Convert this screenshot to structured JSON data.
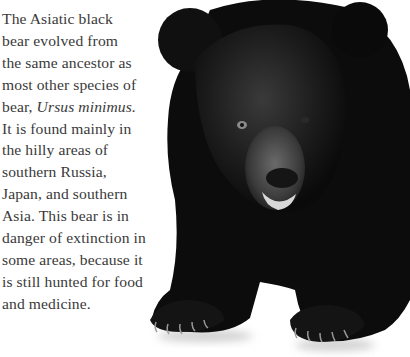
{
  "article": {
    "lines": [
      "The Asiatic black",
      "bear evolved from",
      "the same ancestor as",
      "most other species of",
      "bear, ",
      "It is found mainly in",
      "the hilly areas of",
      "southern Russia,",
      "Japan, and southern",
      "Asia. This bear is in",
      "danger of extinction in",
      "some areas, because it",
      "is still hunted for food",
      "and medicine."
    ],
    "species_name": "Ursus minimus."
  },
  "image": {
    "subject": "Asiatic black bear",
    "fur_color": "#0d0d0d",
    "background": "#ffffff"
  }
}
